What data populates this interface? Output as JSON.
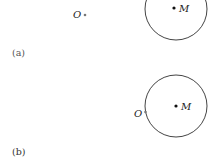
{
  "panels": [
    {
      "caption": "(a)",
      "point_o_label": "O",
      "circle_center_label": "M",
      "description": "Point O lies outside the circle centered at M"
    },
    {
      "caption": "(b)",
      "point_o_label": "O",
      "circle_center_label": "M",
      "description": "Point O lies on the circle centered at M"
    }
  ],
  "colors": {
    "stroke": "#444444",
    "text": "#222222",
    "background": "#ffffff"
  }
}
